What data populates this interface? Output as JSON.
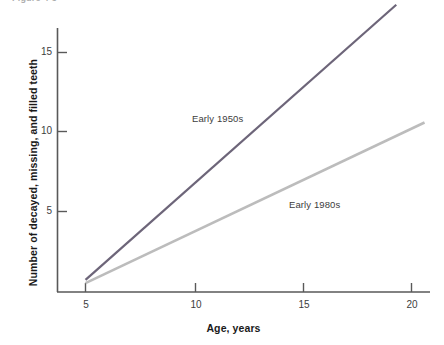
{
  "figure": {
    "clipped_title": "Figure 4-3",
    "background_color": "#ffffff"
  },
  "chart_data": {
    "type": "line",
    "title": "",
    "xlabel": "Age, years",
    "ylabel": "Number of decayed, missing, and filled teeth",
    "xlim": [
      4.2,
      21.4
    ],
    "ylim": [
      0,
      18.6
    ],
    "xticks": [
      5,
      10,
      15,
      20
    ],
    "xtick_labels": [
      "5",
      "10",
      "15",
      "20"
    ],
    "yticks": [
      5,
      10,
      15
    ],
    "ytick_labels": [
      "5",
      "10",
      "15"
    ],
    "grid": false,
    "legend_position": "inline-annotation",
    "series": [
      {
        "name": "Early 1950s",
        "color": "#6d6579",
        "x": [
          5,
          19.3
        ],
        "values": [
          0.7,
          18.0
        ]
      },
      {
        "name": "Early 1980s",
        "color": "#bcbcbc",
        "x": [
          5,
          20.6
        ],
        "values": [
          0.5,
          10.6
        ]
      }
    ],
    "annotations": [
      {
        "text": "Early 1950s",
        "x": 11.7,
        "y": 9.8
      },
      {
        "text": "Early 1980s",
        "x": 16.0,
        "y": 4.4
      }
    ]
  },
  "axis_style": {
    "axis_color": "#595959",
    "tick_color": "#595959",
    "tick_label_color": "#3d3d3d",
    "axis_title_color": "#1a1a1a"
  }
}
